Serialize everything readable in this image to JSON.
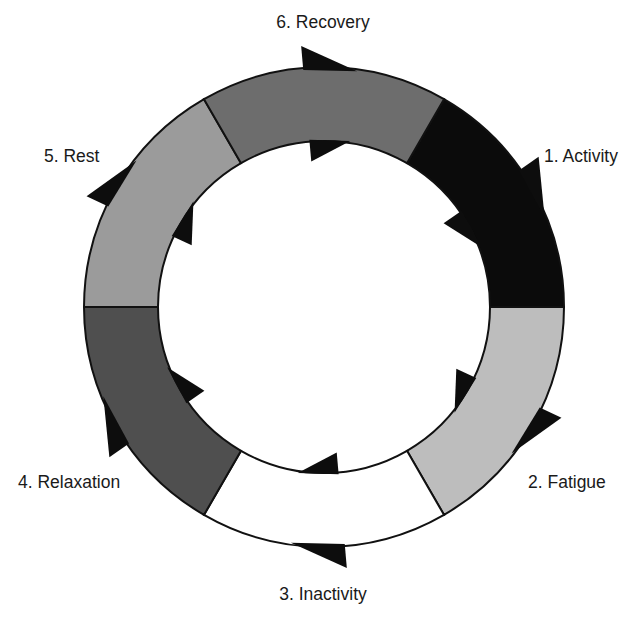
{
  "diagram": {
    "type": "cycle",
    "direction": "clockwise",
    "center": [
      324,
      307
    ],
    "outer_radius": 240,
    "inner_radius": 166,
    "stroke_color": "#111111",
    "arrow_color": "#0d0d0d",
    "stages": [
      {
        "label": "1. Activity",
        "fill": "#0b0b0b",
        "start_deg": 30,
        "end_deg": 90,
        "label_x": 544,
        "label_y": 162,
        "anchor": "start"
      },
      {
        "label": "2. Fatigue",
        "fill": "#bdbdbd",
        "start_deg": 90,
        "end_deg": 150,
        "label_x": 528,
        "label_y": 488,
        "anchor": "start"
      },
      {
        "label": "3. Inactivity",
        "fill": "#ffffff",
        "start_deg": 150,
        "end_deg": 210,
        "label_x": 323,
        "label_y": 600,
        "anchor": "middle"
      },
      {
        "label": "4. Relaxation",
        "fill": "#4f4f4f",
        "start_deg": 210,
        "end_deg": 270,
        "label_x": 18,
        "label_y": 488,
        "anchor": "start"
      },
      {
        "label": "5. Rest",
        "fill": "#9b9b9b",
        "start_deg": 270,
        "end_deg": 330,
        "label_x": 44,
        "label_y": 162,
        "anchor": "start"
      },
      {
        "label": "6. Recovery",
        "fill": "#6d6d6d",
        "start_deg": 330,
        "end_deg": 390,
        "label_x": 323,
        "label_y": 28,
        "anchor": "middle"
      }
    ]
  }
}
